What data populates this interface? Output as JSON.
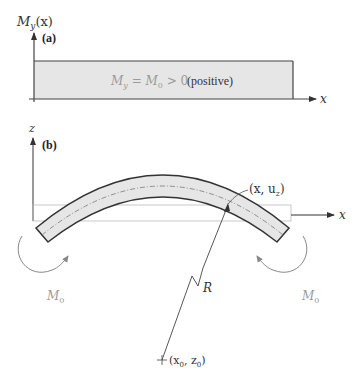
{
  "panel_a": {
    "label": "(a)",
    "y_axis_label_main": "M",
    "y_axis_label_sub": "y",
    "y_axis_label_arg": "(x)",
    "x_axis_label": "x",
    "equation": {
      "lhs_main": "M",
      "lhs_sub": "y",
      "eq": " = ",
      "rhs_main": "M",
      "rhs_sub": "0",
      "rel": " > 0",
      "note": "(positive)"
    }
  },
  "panel_b": {
    "label": "(b)",
    "z_axis_label": "z",
    "x_axis_label": "x",
    "point_label": "(x, u",
    "point_label_sub": "z",
    "point_label_close": ")",
    "radius_label": "R",
    "center_label_open": "(x",
    "center_label_sub1": "0",
    "center_label_mid": ", z",
    "center_label_sub2": "0",
    "center_label_close": ")",
    "moment_left_main": "M",
    "moment_left_sub": "0",
    "moment_right_main": "M",
    "moment_right_sub": "0"
  },
  "colors": {
    "axis": "#555555",
    "beam_fill": "#e6e6e6",
    "beam_edge": "#333333",
    "faint_text": "#9a9a9a",
    "text": "#333333"
  }
}
